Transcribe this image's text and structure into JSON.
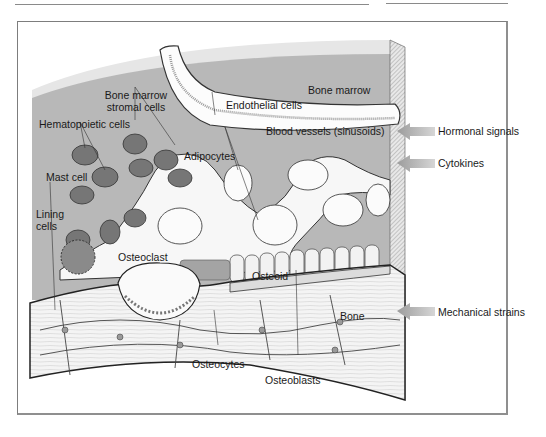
{
  "figure": {
    "labels": {
      "bone_marrow_stromal_cells": "Bone marrow stromal cells",
      "hematopoietic_cells": "Hematopoietic cells",
      "mast_cell": "Mast cell",
      "lining_cells": "Lining cells",
      "osteoclast": "Osteoclast",
      "endothelial_cells": "Endothelial cells",
      "bone_marrow": "Bone marrow",
      "blood_vessels": "Blood vessels (sinusoids)",
      "adipocytes": "Adipocytes",
      "osteoid": "Osteoid",
      "bone": "Bone",
      "osteocytes": "Osteocytes",
      "osteoblasts": "Osteoblasts"
    },
    "signals": [
      {
        "label": "Hormonal signals"
      },
      {
        "label": "Cytokines"
      },
      {
        "label": "Mechanical strains"
      }
    ],
    "colors": {
      "marrow_bg": "#b9b9b9",
      "top_face": "#e4e4e4",
      "cell_dark": "#6e6e6e",
      "bone": "#f2f2f2",
      "arrow": "#a8a8a8"
    }
  }
}
